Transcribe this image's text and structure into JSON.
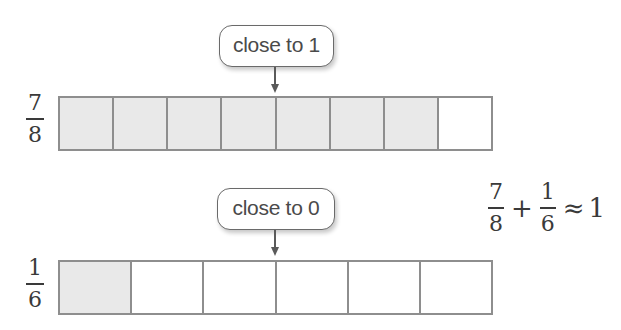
{
  "diagram": {
    "rows": [
      {
        "fraction": {
          "numerator": "7",
          "denominator": "8"
        },
        "total_parts": 8,
        "shaded_parts": 7,
        "callout": "close to 1"
      },
      {
        "fraction": {
          "numerator": "1",
          "denominator": "6"
        },
        "total_parts": 6,
        "shaded_parts": 1,
        "callout": "close to 0"
      }
    ],
    "equation": {
      "term1": {
        "numerator": "7",
        "denominator": "8"
      },
      "operator": "+",
      "term2": {
        "numerator": "1",
        "denominator": "6"
      },
      "relation": "≈",
      "result": "1"
    }
  },
  "colors": {
    "shaded": "#e9e9e9",
    "border": "#8e8e8e",
    "text": "#3a3a3a"
  }
}
